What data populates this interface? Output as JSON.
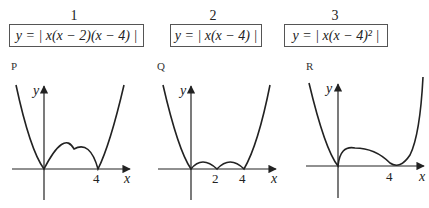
{
  "options": [
    {
      "number": "1",
      "equation": "y = | x(x − 2)(x − 4) |"
    },
    {
      "number": "2",
      "equation": "y = | x(x − 4) |"
    },
    {
      "number": "3",
      "equation": "y = | x(x − 4)² |"
    }
  ],
  "graphs": [
    {
      "label": "P",
      "x_axis": "x",
      "y_axis": "y",
      "ticks": [
        "4"
      ]
    },
    {
      "label": "Q",
      "x_axis": "x",
      "y_axis": "y",
      "ticks": [
        "2",
        "4"
      ]
    },
    {
      "label": "R",
      "x_axis": "x",
      "y_axis": "y",
      "ticks": [
        "4"
      ]
    }
  ]
}
